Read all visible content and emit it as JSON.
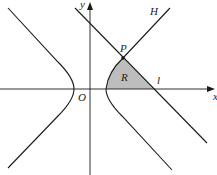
{
  "diagram": {
    "type": "hyperbola-region",
    "labels": {
      "y_axis": "y",
      "x_axis": "x",
      "origin": "O",
      "line_H": "H",
      "point_P": "P",
      "region_R": "R",
      "line_l": "l"
    },
    "colors": {
      "stroke": "#1a1a1a",
      "region_fill": "#bdbdbd",
      "background": "#ffffff"
    }
  }
}
